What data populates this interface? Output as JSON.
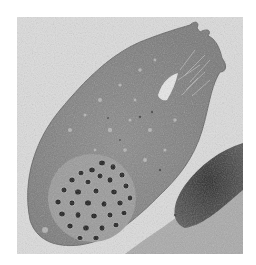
{
  "image": {
    "kind": "electron-micrograph",
    "description": "Transmission electron micrograph of an elongated cell containing a cluster of dark secretory granules, with an adjacent dark-staining cell at lower right",
    "frame": {
      "x": 17,
      "y": 17,
      "width": 226,
      "height": 237
    },
    "colors": {
      "background": "#dcdcdc",
      "cytoplasm": "#8c8c8c",
      "granule": "#1a1a1a",
      "granule_halo": "#b4b4b4",
      "dark_cell": "#3a3a3a",
      "lower_tissue": "#a8a8a8"
    },
    "features": [
      {
        "name": "cell-body",
        "label": "elongated cell"
      },
      {
        "name": "granule-cluster",
        "label": "dark granule cluster"
      },
      {
        "name": "apical-tip",
        "label": "apical processes / microvilli"
      },
      {
        "name": "vacuole",
        "label": "clear vacuole near tip"
      },
      {
        "name": "adjacent-dark-cell",
        "label": "neighbouring dark cell"
      }
    ]
  }
}
